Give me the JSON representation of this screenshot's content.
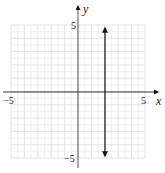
{
  "chart_data": {
    "type": "line",
    "title": "",
    "xlabel": "x",
    "ylabel": "y",
    "xlim": [
      -5,
      5
    ],
    "ylim": [
      -5,
      5
    ],
    "grid": true,
    "x_tick_labels": [
      "-5",
      "5"
    ],
    "y_tick_labels": [
      "5",
      "-5"
    ],
    "series": [
      {
        "name": "vertical line x = 2",
        "equation": "x = 2",
        "points": [
          [
            2,
            5
          ],
          [
            2,
            -5
          ]
        ],
        "arrows": "both",
        "color": "#111111"
      }
    ]
  },
  "labels": {
    "x_axis": "x",
    "y_axis": "y",
    "x_min": "−5",
    "x_max": "5",
    "y_max": "5",
    "y_min": "−5"
  },
  "colors": {
    "grid": "#dcdcdc",
    "axis": "#333333",
    "line": "#111111"
  }
}
